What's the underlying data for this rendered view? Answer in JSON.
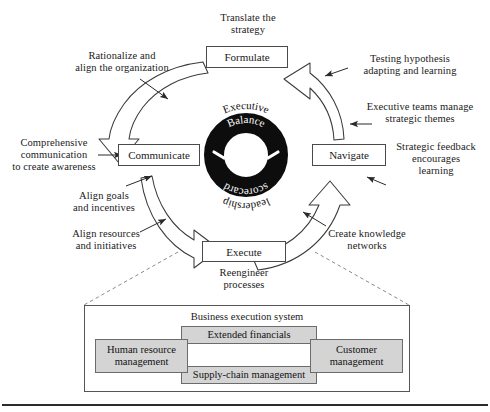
{
  "diagram": {
    "center_ring": {
      "top_arc": "Executive",
      "inner_top": "Balance",
      "inner_bottom": "scorecard",
      "bottom_arc": "leadership",
      "ring_color": "#0d0d0d",
      "text_color_inner": "#ffffff",
      "text_color_outer": "#111111"
    },
    "nodes": [
      {
        "id": "formulate",
        "label": "Formulate"
      },
      {
        "id": "communicate",
        "label": "Communicate"
      },
      {
        "id": "navigate",
        "label": "Navigate"
      },
      {
        "id": "execute",
        "label": "Execute"
      }
    ],
    "annotations": [
      {
        "id": "translate-the-strategy",
        "text": "Translate the\nstrategy"
      },
      {
        "id": "rationalize-and-align",
        "text": "Rationalize and\nalign the organization"
      },
      {
        "id": "comprehensive-communication",
        "text": "Comprehensive\ncommunication\nto create awareness"
      },
      {
        "id": "align-goals-and-incentives",
        "text": "Align goals\nand incentives"
      },
      {
        "id": "align-resources-and-initiatives",
        "text": "Align resources\nand initiatives"
      },
      {
        "id": "reengineer-processes",
        "text": "Reengineer\nprocesses"
      },
      {
        "id": "create-knowledge-networks",
        "text": "Create knowledge\nnetworks"
      },
      {
        "id": "strategic-feedback",
        "text": "Strategic feedback\nencourages\nlearning"
      },
      {
        "id": "executive-teams-manage",
        "text": "Executive teams manage\nstrategic themes"
      },
      {
        "id": "testing-hypothesis",
        "text": "Testing hypothesis\nadapting and learning"
      }
    ],
    "execution_system": {
      "title": "Business execution system",
      "components": [
        {
          "id": "human-resource-management",
          "label": "Human resource\nmanagement"
        },
        {
          "id": "extended-financials",
          "label": "Extended financials"
        },
        {
          "id": "supply-chain-management",
          "label": "Supply-chain management"
        },
        {
          "id": "customer-management",
          "label": "Customer\nmanagement"
        }
      ],
      "box_fill": "#d4d4d4",
      "box_stroke": "#6b6b6b"
    },
    "styles": {
      "node_stroke": "#4a4a4a",
      "arrow_stroke": "#333333",
      "dashed_stroke": "#777777",
      "background": "#ffffff"
    }
  }
}
